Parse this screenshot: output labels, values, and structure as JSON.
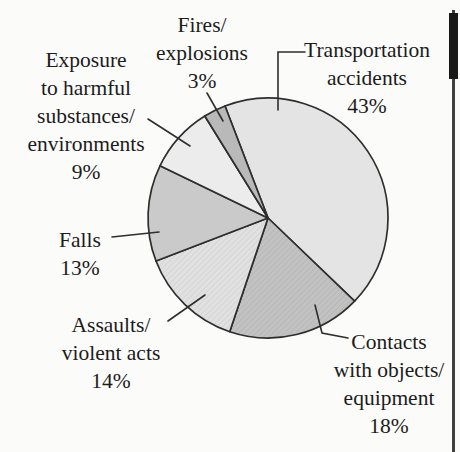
{
  "chart_data": {
    "type": "pie",
    "title": "",
    "unit": "%",
    "legend": "none",
    "stroke_color": "#2e2e2e",
    "background": "#fbfbf9",
    "slices": [
      {
        "label": "Transportation accidents",
        "value": 43,
        "pct": "43%",
        "color": "#e4e4e4",
        "texture": "none",
        "lines": [
          "Transportation",
          "accidents",
          "43%"
        ]
      },
      {
        "label": "Contacts with objects/equipment",
        "value": 18,
        "pct": "18%",
        "color": "#c2c2c2",
        "texture": "hatch",
        "lines": [
          "Contacts",
          "with objects/",
          "equipment",
          "18%"
        ]
      },
      {
        "label": "Assaults/violent acts",
        "value": 14,
        "pct": "14%",
        "color": "#e1e1e1",
        "texture": "hatch",
        "lines": [
          "Assaults/",
          "violent acts",
          "14%"
        ]
      },
      {
        "label": "Falls",
        "value": 13,
        "pct": "13%",
        "color": "#cacaca",
        "texture": "none",
        "lines": [
          "Falls",
          "13%"
        ]
      },
      {
        "label": "Exposure to harmful substances/environments",
        "value": 9,
        "pct": "9%",
        "color": "#ececec",
        "texture": "none",
        "lines": [
          "Exposure",
          "to harmful",
          "substances/",
          "environments",
          "9%"
        ]
      },
      {
        "label": "Fires/explosions",
        "value": 3,
        "pct": "3%",
        "color": "#b9b9b9",
        "texture": "none",
        "lines": [
          "Fires/",
          "explosions",
          "3%"
        ]
      }
    ]
  }
}
